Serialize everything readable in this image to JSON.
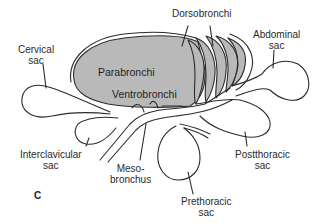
{
  "figure": {
    "panel_letter": "C",
    "colors": {
      "lung_fill": "#b9b9b9",
      "stroke": "#2b2b2b",
      "background": "#ffffff"
    }
  },
  "labels": {
    "dorsobronchi": "Dorsobronchi",
    "cervical": {
      "line1": "Cervical",
      "line2": "sac"
    },
    "abdominal": {
      "line1": "Abdominal",
      "line2": "sac"
    },
    "parabronchi": "Parabronchi",
    "ventrobronchi": "Ventrobronchi",
    "interclavicular": {
      "line1": "Interclavicular",
      "line2": "sac"
    },
    "mesobronchus": {
      "line1": "Meso-",
      "line2": "bronchus"
    },
    "postthoracic": {
      "line1": "Postthoracic",
      "line2": "sac"
    },
    "prethoracic": {
      "line1": "Prethoracic",
      "line2": "sac"
    }
  }
}
